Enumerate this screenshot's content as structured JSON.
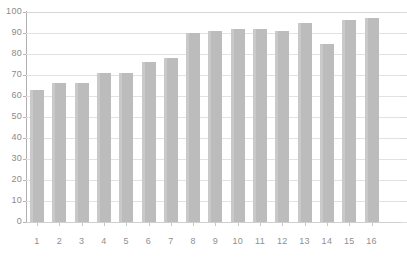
{
  "chart_data": {
    "type": "bar",
    "title": "",
    "subtitle": "",
    "xlabel": "",
    "ylabel": "",
    "categories": [
      "1",
      "2",
      "3",
      "4",
      "5",
      "6",
      "7",
      "8",
      "9",
      "10",
      "11",
      "12",
      "13",
      "14",
      "15",
      "16"
    ],
    "values": [
      63,
      66,
      66,
      71,
      71,
      76,
      78,
      90,
      91,
      92,
      92,
      91,
      95,
      85,
      96,
      97
    ],
    "series": [
      {
        "name": "",
        "values": [
          63,
          66,
          66,
          71,
          71,
          76,
          78,
          90,
          91,
          92,
          92,
          91,
          95,
          85,
          96,
          97
        ]
      }
    ],
    "ylim": [
      0,
      100
    ],
    "y_ticks": [
      0,
      10,
      20,
      30,
      40,
      50,
      60,
      70,
      80,
      90,
      100
    ],
    "y_tick_labels": [
      "0",
      "10",
      "20",
      "30",
      "40",
      "50",
      "60",
      "70",
      "80",
      "90",
      "100"
    ],
    "grid": true,
    "grid_axis": "y",
    "legend": false,
    "legend_position": "none",
    "bar_color": "#bcbcbc",
    "grid_color": "#e2e2e2",
    "axis_color": "#b0b0b0",
    "background_color": "#ffffff",
    "tick_label_color": "#8a8a8a"
  }
}
